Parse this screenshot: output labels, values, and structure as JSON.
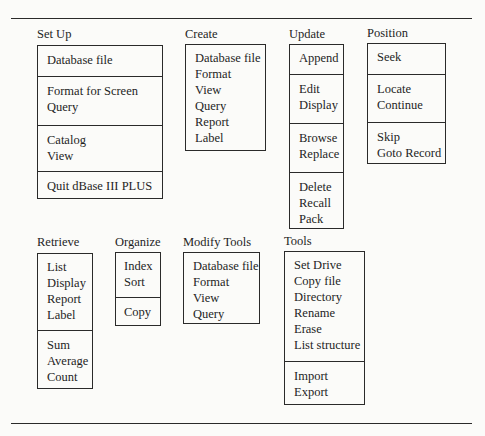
{
  "diagram": {
    "rules": [
      {
        "id": "top-rule",
        "x": 11,
        "y": 18,
        "w": 461
      },
      {
        "id": "bottom-rule",
        "x": 11,
        "y": 423,
        "w": 461
      }
    ],
    "menus": [
      {
        "id": "set-up",
        "label": "Set Up",
        "label_pos": [
          37,
          27
        ],
        "box": [
          37,
          45,
          126,
          154
        ],
        "sections": [
          {
            "top": 0,
            "pad": 6,
            "items": [
              "Database file"
            ]
          },
          {
            "top": 30,
            "pad": 6,
            "items": [
              "Format for Screen",
              "Query"
            ]
          },
          {
            "top": 79,
            "pad": 6,
            "items": [
              "Catalog",
              "View"
            ]
          },
          {
            "top": 125,
            "pad": 6,
            "items": [
              "Quit dBase III PLUS"
            ]
          }
        ]
      },
      {
        "id": "create",
        "label": "Create",
        "label_pos": [
          185,
          27
        ],
        "box": [
          185,
          44,
          81,
          107
        ],
        "sections": [
          {
            "top": 0,
            "pad": 5,
            "items": [
              "Database file",
              "Format",
              "View",
              "Query",
              "Report",
              "Label"
            ]
          }
        ]
      },
      {
        "id": "update",
        "label": "Update",
        "label_pos": [
          289,
          27
        ],
        "box": [
          289,
          44,
          55,
          185
        ],
        "sections": [
          {
            "top": 0,
            "pad": 5,
            "items": [
              "Append"
            ]
          },
          {
            "top": 29,
            "pad": 6,
            "items": [
              "Edit",
              "Display"
            ]
          },
          {
            "top": 78,
            "pad": 6,
            "items": [
              "Browse",
              "Replace"
            ]
          },
          {
            "top": 127,
            "pad": 6,
            "items": [
              "Delete",
              "Recall",
              "Pack"
            ]
          }
        ]
      },
      {
        "id": "position",
        "label": "Position",
        "label_pos": [
          367,
          26
        ],
        "box": [
          367,
          43,
          79,
          121
        ],
        "sections": [
          {
            "top": 0,
            "pad": 5,
            "items": [
              "Seek"
            ]
          },
          {
            "top": 30,
            "pad": 6,
            "items": [
              "Locate",
              "Continue"
            ]
          },
          {
            "top": 78,
            "pad": 6,
            "items": [
              "Skip",
              "Goto Record"
            ]
          }
        ]
      },
      {
        "id": "retrieve",
        "label": "Retrieve",
        "label_pos": [
          37,
          235
        ],
        "box": [
          37,
          253,
          56,
          136
        ],
        "sections": [
          {
            "top": 0,
            "pad": 5,
            "items": [
              "List",
              "Display",
              "Report",
              "Label"
            ]
          },
          {
            "top": 76,
            "pad": 6,
            "items": [
              "Sum",
              "Average",
              "Count"
            ]
          }
        ]
      },
      {
        "id": "organize",
        "label": "Organize",
        "label_pos": [
          115,
          235
        ],
        "box": [
          115,
          252,
          46,
          74
        ],
        "sections": [
          {
            "top": 0,
            "pad": 5,
            "items": [
              "Index",
              "Sort"
            ]
          },
          {
            "top": 44,
            "pad": 6,
            "items": [
              "Copy"
            ]
          }
        ]
      },
      {
        "id": "modify-tools",
        "label": "Modify Tools",
        "label_pos": [
          183,
          235
        ],
        "box": [
          183,
          252,
          77,
          72
        ],
        "sections": [
          {
            "top": 0,
            "pad": 5,
            "items": [
              "Database file",
              "Format",
              "View",
              "Query"
            ]
          }
        ]
      },
      {
        "id": "tools",
        "label": "Tools",
        "label_pos": [
          284,
          234
        ],
        "box": [
          284,
          251,
          81,
          154
        ],
        "sections": [
          {
            "top": 0,
            "pad": 5,
            "items": [
              "Set Drive",
              "Copy file",
              "Directory",
              "Rename",
              "Erase",
              "List structure"
            ]
          },
          {
            "top": 109,
            "pad": 6,
            "items": [
              "Import",
              "Export"
            ]
          }
        ]
      }
    ]
  }
}
